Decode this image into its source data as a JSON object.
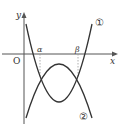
{
  "diagram": {
    "type": "function-graph",
    "axes": {
      "x_label": "x",
      "y_label": "y",
      "origin_label": "O"
    },
    "points": {
      "alpha_label": "α",
      "beta_label": "β"
    },
    "curves": [
      {
        "id": "1",
        "label": "①",
        "shape": "upward parabola"
      },
      {
        "id": "2",
        "label": "②",
        "shape": "downward parabola"
      }
    ],
    "colors": {
      "stroke": "#333333",
      "dashed": "#888888",
      "background": "#ffffff"
    }
  }
}
